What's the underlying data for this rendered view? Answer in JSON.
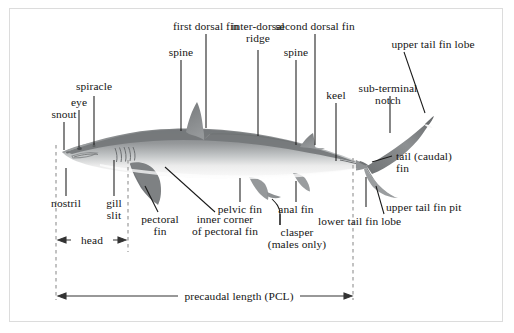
{
  "figure": {
    "border_color": "#dcdcdc",
    "background": "#ffffff",
    "text_color": "#151515",
    "leader_line_color": "#1a1a1a",
    "dashed_line_color": "#9a9a9a",
    "body_dark": "#8a8d8e",
    "body_mid": "#b4b7b8",
    "body_light": "#f2f2f2",
    "fin_dark": "#7b7e80"
  },
  "labels": {
    "snout": "snout",
    "eye": "eye",
    "spiracle": "spiracle",
    "nostril": "nostril",
    "gill_slit": "gill\nslit",
    "first_dorsal_fin": "first dorsal fin",
    "spine_first": "spine",
    "inter_dorsal_ridge": "inter-dorsal\nridge",
    "spine_second": "spine",
    "second_dorsal_fin": "second dorsal fin",
    "keel": "keel",
    "upper_tail_fin_lobe": "upper tail fin lobe",
    "sub_terminal_notch": "sub-terminal\nnotch",
    "tail_caudal_fin": "tail (caudal)\nfin",
    "upper_tail_fin_pit": "upper tail fin pit",
    "lower_tail_fin_lobe": "lower tail fin lobe",
    "pectoral_fin": "pectoral\nfin",
    "inner_corner_of_pectoral_fin": "inner corner\nof pectoral fin",
    "pelvic_fin": "pelvic fin",
    "anal_fin": "anal fin",
    "clasper": "clasper\n(males only)",
    "head_measure": "head",
    "precaudal_length": "precaudal length (PCL)"
  }
}
